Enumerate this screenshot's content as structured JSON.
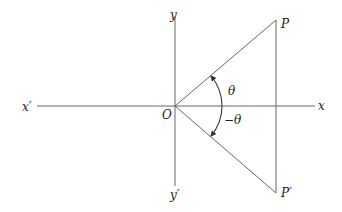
{
  "diagram": {
    "labels": {
      "x_positive": "x",
      "x_negative": "x′",
      "y_positive": "y",
      "y_negative": "y′",
      "origin": "O",
      "point_p": "P",
      "point_p_prime": "P′",
      "angle_positive": "θ",
      "angle_negative": "−θ"
    },
    "colors": {
      "line": "#555555",
      "text": "#222222",
      "background": "#ffffff"
    }
  }
}
